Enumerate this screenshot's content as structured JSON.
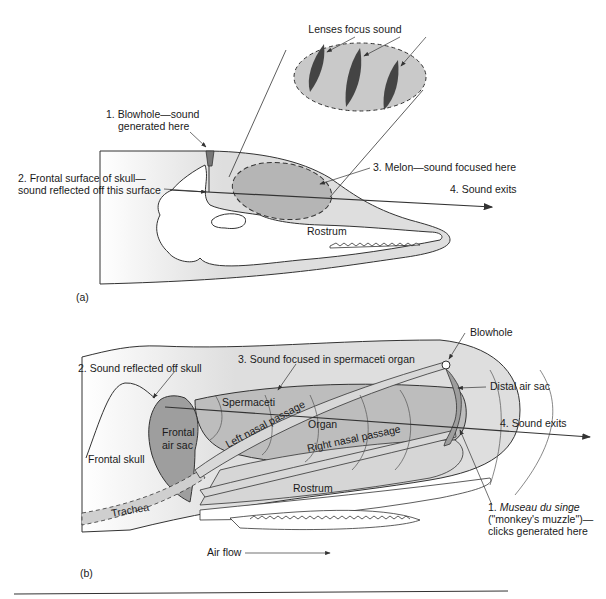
{
  "panel_a": {
    "tag": "(a)",
    "labels": {
      "lenses": "Lenses focus sound",
      "blowhole_1": "1. Blowhole—sound",
      "blowhole_2": "generated here",
      "frontal_1": "2. Frontal surface of skull—",
      "frontal_2": "sound reflected off this surface",
      "melon": "3. Melon—sound focused here",
      "exits": "4. Sound exits",
      "rostrum": "Rostrum"
    }
  },
  "panel_b": {
    "tag": "(b)",
    "labels": {
      "reflected": "2. Sound reflected off skull",
      "focused": "3. Sound focused in spermaceti organ",
      "blowhole": "Blowhole",
      "distal": "Distal air sac",
      "exits": "4. Sound exits",
      "spermaceti": "Spermaceti",
      "organ": "Organ",
      "left_nasal": "Left nasal passage",
      "right_nasal": "Right nasal passage",
      "frontal_air_1": "Frontal",
      "frontal_air_2": "air sac",
      "frontal_skull": "Frontal skull",
      "rostrum": "Rostrum",
      "trachea": "Trachea",
      "museau_num": "1. ",
      "museau_it": "Museau du singe",
      "museau_2": "(\"monkey's muzzle\")—",
      "museau_3": "clicks generated here",
      "air_flow": "Air flow"
    }
  },
  "colors": {
    "light_gray": "#dcdcdc",
    "mid_gray": "#b4b4b4",
    "dark_gray": "#4a4a4a",
    "line": "#2a2a2a"
  }
}
